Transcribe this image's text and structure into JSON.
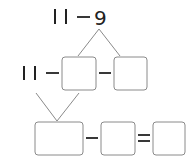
{
  "diagram": {
    "top_expression": {
      "left": "11",
      "operator": "−",
      "right": "9"
    },
    "middle_row": {
      "start": "11",
      "op1": "−",
      "box1": "",
      "op2": "−",
      "box2": ""
    },
    "bottom_row": {
      "box3": "",
      "op1": "−",
      "box4": "",
      "op2": "=",
      "box5": ""
    }
  },
  "colors": {
    "box_border": "#8a8a8a",
    "line": "#8a8a8a",
    "text": "#222222"
  }
}
